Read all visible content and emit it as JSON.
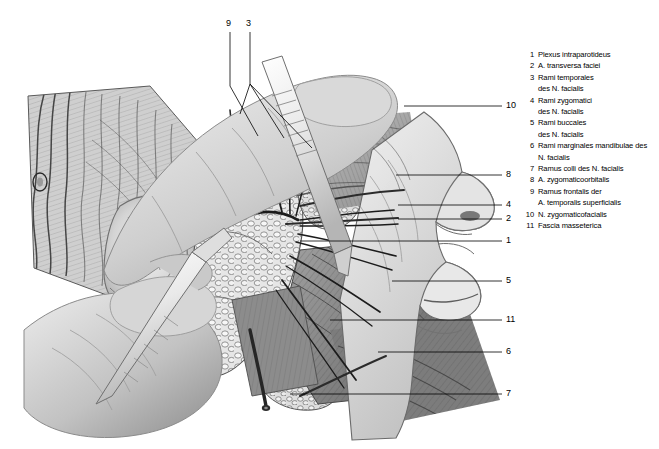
{
  "figure": {
    "background_color": "#ffffff",
    "ink_color": "#000000"
  },
  "callouts": [
    {
      "id": "c9",
      "label": "9",
      "x": 230,
      "y": 24,
      "position": "top"
    },
    {
      "id": "c3",
      "label": "3",
      "x": 250,
      "y": 24,
      "position": "top"
    },
    {
      "id": "c10",
      "label": "10",
      "x": 508,
      "y": 106,
      "position": "right"
    },
    {
      "id": "c8",
      "label": "8",
      "x": 508,
      "y": 175,
      "position": "right"
    },
    {
      "id": "c4",
      "label": "4",
      "x": 508,
      "y": 205,
      "position": "right"
    },
    {
      "id": "c2",
      "label": "2",
      "x": 508,
      "y": 219,
      "position": "right"
    },
    {
      "id": "c1",
      "label": "1",
      "x": 508,
      "y": 241,
      "position": "right"
    },
    {
      "id": "c5",
      "label": "5",
      "x": 508,
      "y": 281,
      "position": "right"
    },
    {
      "id": "c11",
      "label": "11",
      "x": 508,
      "y": 320,
      "position": "right"
    },
    {
      "id": "c6",
      "label": "6",
      "x": 508,
      "y": 352,
      "position": "right"
    },
    {
      "id": "c7",
      "label": "7",
      "x": 508,
      "y": 394,
      "position": "right"
    }
  ],
  "legend": {
    "items": [
      {
        "num": "1",
        "lines": [
          "Plexus intraparotideus"
        ]
      },
      {
        "num": "2",
        "lines": [
          "A. transversa faciei"
        ]
      },
      {
        "num": "3",
        "lines": [
          "Rami temporales",
          "des N. facialis"
        ]
      },
      {
        "num": "4",
        "lines": [
          "Rami zygomatici",
          "des N. facialis"
        ]
      },
      {
        "num": "5",
        "lines": [
          "Rami buccales",
          "des N. facialis"
        ]
      },
      {
        "num": "6",
        "lines": [
          "Rami marginales mandibulae des",
          "N. facialis"
        ]
      },
      {
        "num": "7",
        "lines": [
          "Ramus colli des N. facialis"
        ]
      },
      {
        "num": "8",
        "lines": [
          "A. zygomaticoorbitalis"
        ]
      },
      {
        "num": "9",
        "lines": [
          "Ramus frontalis der",
          "A. temporalis superficialis"
        ]
      },
      {
        "num": "10",
        "lines": [
          "N. zygomaticofacialis"
        ]
      },
      {
        "num": "11",
        "lines": [
          "Fascia masseterica"
        ]
      }
    ]
  }
}
